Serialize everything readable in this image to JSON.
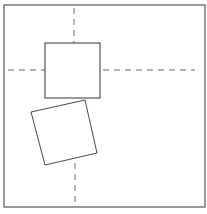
{
  "diagram": {
    "stroke_color": "#333333",
    "frame_color": "#555555",
    "frame": {
      "x": 4,
      "y": 5,
      "width": 201,
      "height": 202
    },
    "upright_square": {
      "x": 45,
      "y": 43,
      "width": 55,
      "height": 55
    },
    "rotated_square": {
      "points": "31,112 85,100 97,153 45,165"
    },
    "dashed_lines": {
      "vertical_top": {
        "x1": 74,
        "y1": 8,
        "x2": 74,
        "y2": 43
      },
      "horizontal_left": {
        "x1": 8,
        "y1": 70,
        "x2": 45,
        "y2": 70
      },
      "horizontal_right": {
        "x1": 100,
        "y1": 70,
        "x2": 195,
        "y2": 70
      },
      "vertical_bottom": {
        "x1": 75,
        "y1": 163,
        "x2": 75,
        "y2": 206
      }
    }
  }
}
